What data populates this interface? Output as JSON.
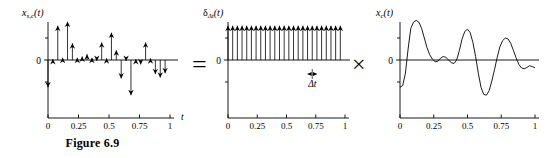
{
  "figure": {
    "caption": "Figure 6.9",
    "equals_symbol": "=",
    "times_symbol": "×"
  },
  "panels": {
    "sampled": {
      "signal_label_main": "x",
      "signal_label_sub": "s,c",
      "signal_label_arg": "(t)",
      "y_zero_label": "0",
      "x_axis_label": "t",
      "x_ticks": [
        "0",
        "0.25",
        "0.5",
        "0.75",
        "1"
      ]
    },
    "impulse": {
      "signal_label_main": "δ",
      "signal_label_sub": "Δt",
      "signal_label_arg": "(t)",
      "y_zero_label": "0",
      "x_axis_label": "t",
      "x_ticks": [
        "0",
        "0.25",
        "0.5",
        "0.75",
        "1"
      ],
      "spacing_annotation": "Δt"
    },
    "continuous": {
      "signal_label_main": "x",
      "signal_label_sub": "c",
      "signal_label_arg": "(t)",
      "y_zero_label": "0",
      "x_ticks": [
        "0",
        "0.25",
        "0.5",
        "0.75",
        "1"
      ]
    }
  },
  "chart_data": [
    {
      "type": "stem",
      "name": "x_s,c(t) impulse-train sampled signal",
      "title": "x_s,c(t)",
      "xlabel": "t",
      "ylabel": "",
      "xlim": [
        0,
        1
      ],
      "ylim": [
        -1.05,
        1.0
      ],
      "xticks": [
        0,
        0.25,
        0.5,
        0.75,
        1
      ],
      "xticklabels": [
        "0",
        "0.25",
        "0.5",
        "0.75",
        "1"
      ],
      "grid": false,
      "x": [
        0.0,
        0.04,
        0.08,
        0.12,
        0.16,
        0.2,
        0.24,
        0.28,
        0.32,
        0.36,
        0.4,
        0.44,
        0.48,
        0.52,
        0.56,
        0.6,
        0.64,
        0.68,
        0.72,
        0.76,
        0.8,
        0.84,
        0.88,
        0.92,
        0.96
      ],
      "values": [
        -0.62,
        0.02,
        0.78,
        0.05,
        0.87,
        0.38,
        0.05,
        0.08,
        0.13,
        0.05,
        -0.02,
        0.4,
        0.04,
        0.62,
        0.22,
        -0.42,
        -0.02,
        -0.8,
        0.02,
        -0.1,
        0.4,
        0.04,
        -0.32,
        -0.4,
        -0.3
      ]
    },
    {
      "type": "stem",
      "name": "delta_dt(t) impulse train",
      "title": "δΔt(t)",
      "xlabel": "t",
      "ylabel": "",
      "xlim": [
        0,
        1
      ],
      "ylim": [
        -1.05,
        1.0
      ],
      "xticks": [
        0,
        0.25,
        0.5,
        0.75,
        1
      ],
      "xticklabels": [
        "0",
        "0.25",
        "0.5",
        "0.75",
        "1"
      ],
      "grid": false,
      "spacing": 0.04,
      "x": [
        0.0,
        0.04,
        0.08,
        0.12,
        0.16,
        0.2,
        0.24,
        0.28,
        0.32,
        0.36,
        0.4,
        0.44,
        0.48,
        0.52,
        0.56,
        0.6,
        0.64,
        0.68,
        0.72,
        0.76,
        0.8,
        0.84,
        0.88,
        0.92,
        0.96
      ],
      "values": [
        0.78,
        0.78,
        0.78,
        0.78,
        0.78,
        0.78,
        0.78,
        0.78,
        0.78,
        0.78,
        0.78,
        0.78,
        0.78,
        0.78,
        0.78,
        0.78,
        0.78,
        0.78,
        0.78,
        0.78,
        0.78,
        0.78,
        0.78,
        0.78,
        0.78
      ]
    },
    {
      "type": "line",
      "name": "x_c(t) continuous-time signal",
      "title": "x_c(t)",
      "xlabel": "",
      "ylabel": "",
      "xlim": [
        0,
        1
      ],
      "ylim": [
        -1.05,
        1.0
      ],
      "xticks": [
        0,
        0.25,
        0.5,
        0.75,
        1
      ],
      "xticklabels": [
        "0",
        "0.25",
        "0.5",
        "0.75",
        "1"
      ],
      "grid": false,
      "x": [
        0.0,
        0.02,
        0.04,
        0.06,
        0.08,
        0.1,
        0.12,
        0.14,
        0.16,
        0.18,
        0.2,
        0.22,
        0.24,
        0.26,
        0.28,
        0.3,
        0.32,
        0.34,
        0.36,
        0.38,
        0.4,
        0.42,
        0.44,
        0.46,
        0.48,
        0.5,
        0.52,
        0.54,
        0.56,
        0.58,
        0.6,
        0.62,
        0.64,
        0.66,
        0.68,
        0.7,
        0.72,
        0.74,
        0.76,
        0.78,
        0.8,
        0.82,
        0.84,
        0.86,
        0.88,
        0.9,
        0.92,
        0.94,
        0.96,
        0.98,
        1.0
      ],
      "values": [
        -0.62,
        -0.58,
        -0.3,
        0.25,
        0.72,
        0.86,
        0.9,
        0.86,
        0.72,
        0.5,
        0.28,
        0.12,
        0.02,
        -0.04,
        -0.03,
        0.04,
        0.08,
        0.06,
        0.0,
        -0.06,
        -0.08,
        0.0,
        0.22,
        0.48,
        0.65,
        0.7,
        0.62,
        0.4,
        0.08,
        -0.3,
        -0.62,
        -0.78,
        -0.8,
        -0.7,
        -0.48,
        -0.22,
        0.06,
        0.3,
        0.44,
        0.5,
        0.48,
        0.38,
        0.22,
        0.05,
        -0.1,
        -0.18,
        -0.2,
        -0.17,
        -0.13,
        -0.15,
        -0.18
      ]
    }
  ]
}
